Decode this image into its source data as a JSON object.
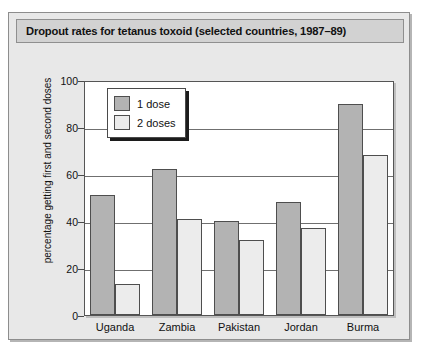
{
  "chart_data": {
    "type": "bar",
    "title": "Dropout rates for tetanus toxoid (selected countries, 1987–89)",
    "xlabel": "",
    "ylabel": "percentage getting first and second doses",
    "categories": [
      "Uganda",
      "Zambia",
      "Pakistan",
      "Jordan",
      "Burma"
    ],
    "series": [
      {
        "name": "1 dose",
        "values": [
          51,
          62,
          40,
          48,
          90
        ],
        "color": "#b3b3b3"
      },
      {
        "name": "2 doses",
        "values": [
          13,
          41,
          32,
          37,
          68
        ],
        "color": "#ececec"
      }
    ],
    "ylim": [
      0,
      100
    ],
    "yticks": [
      0,
      20,
      40,
      60,
      80,
      100
    ],
    "ytick_labels": [
      "0",
      "20",
      "40",
      "60",
      "80",
      "100"
    ],
    "grid": true,
    "grid_axis": "y",
    "legend_position": "upper-left-inside"
  },
  "legend": {
    "entries": [
      {
        "label": "1 dose"
      },
      {
        "label": "2 doses"
      }
    ]
  },
  "colors": {
    "figure_background": "#e8e8e8",
    "title_background": "#d2d2d2",
    "plot_background": "#ffffff",
    "bar_dose1": "#b3b3b3",
    "bar_dose2": "#ececec",
    "border": "#4e4e4e"
  }
}
